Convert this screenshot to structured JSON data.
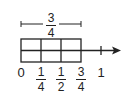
{
  "diagram": {
    "bracket_label": {
      "numerator": "3",
      "denominator": "4"
    },
    "strip": {
      "columns": 3,
      "rows": 2
    },
    "axis_labels": [
      {
        "type": "whole",
        "text": "0"
      },
      {
        "type": "fraction",
        "numerator": "1",
        "denominator": "4"
      },
      {
        "type": "fraction",
        "numerator": "1",
        "denominator": "2"
      },
      {
        "type": "fraction",
        "numerator": "3",
        "denominator": "4"
      },
      {
        "type": "whole",
        "text": "1"
      }
    ],
    "colors": {
      "stroke": "#222222",
      "background": "#ffffff"
    }
  }
}
